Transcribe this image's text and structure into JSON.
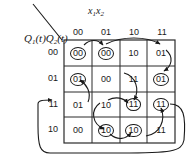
{
  "diagram": {
    "kind": "state-transition-table",
    "title_state_axis": "Q1(t)Q2(t)",
    "title_input_axis": "x1x2",
    "state_axis": {
      "symbol": "Q",
      "sub1": "1",
      "sub2": "2",
      "arg": "(t)",
      "text": "Q1(t)Q2(t)"
    },
    "input_axis": {
      "symbol_a": "x",
      "sub_a": "1",
      "symbol_b": "x",
      "sub_b": "2",
      "text": "x1x2"
    },
    "column_headers": [
      "00",
      "01",
      "10",
      "11"
    ],
    "row_headers": [
      "00",
      "01",
      "11",
      "10"
    ],
    "rows": [
      {
        "header": "00",
        "cells": [
          {
            "value": "00",
            "stable": true
          },
          {
            "value": "00",
            "stable": true
          },
          {
            "value": "10",
            "stable": false
          },
          {
            "value": "01",
            "stable": false
          }
        ]
      },
      {
        "header": "01",
        "cells": [
          {
            "value": "01",
            "stable": true
          },
          {
            "value": "00",
            "stable": false
          },
          {
            "value": "11",
            "stable": false
          },
          {
            "value": "01",
            "stable": true
          }
        ]
      },
      {
        "header": "11",
        "cells": [
          {
            "value": "01",
            "stable": false
          },
          {
            "value": "10",
            "stable": false
          },
          {
            "value": "11",
            "stable": true
          },
          {
            "value": "11",
            "stable": true
          }
        ]
      },
      {
        "header": "10",
        "cells": [
          {
            "value": "00",
            "stable": false
          },
          {
            "value": "10",
            "stable": true
          },
          {
            "value": "10",
            "stable": true
          },
          {
            "value": "11",
            "stable": false
          }
        ]
      }
    ],
    "colors": {
      "ink": "#1a1a1a",
      "grid": "#2a2a2a",
      "background": "#ffffff"
    }
  }
}
